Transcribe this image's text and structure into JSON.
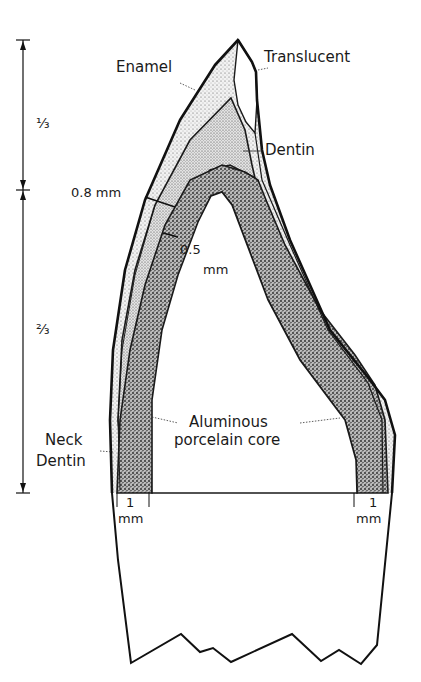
{
  "diagram": {
    "type": "dental cross-section",
    "labels": {
      "enamel": "Enamel",
      "translucent": "Translucent",
      "dentin": "Dentin",
      "thickness_incisal": "0.8 mm",
      "core_thickness_value": "0.5",
      "core_thickness_unit": "mm",
      "core_line1": "Aluminous",
      "core_line2": "porcelain core",
      "neck_line1": "Neck",
      "neck_line2": "Dentin",
      "shoulder_left_value": "1",
      "shoulder_left_unit": "mm",
      "shoulder_right_value": "1",
      "shoulder_right_unit": "mm"
    },
    "dimension": {
      "upper_fraction": "⅓",
      "lower_fraction": "⅔"
    },
    "colors": {
      "line": "#1a1a1a",
      "background": "#ffffff",
      "enamel_fill": "#e6e6e6",
      "dentin_fill": "#d4d4d4",
      "core_fill": "#9c9c9c"
    }
  }
}
